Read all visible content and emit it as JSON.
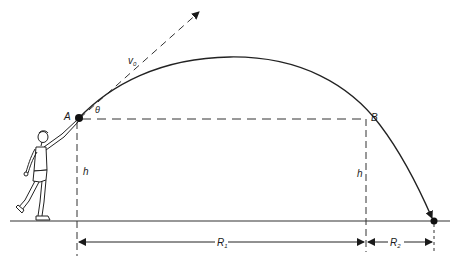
{
  "diagram": {
    "type": "projectile-motion",
    "colors": {
      "ink": "#1a1a1a",
      "dashed": "#333333",
      "background": "#ffffff"
    },
    "labels": {
      "point_a": "A",
      "point_b": "B",
      "velocity": "v",
      "velocity_sub": "0",
      "angle": "θ",
      "height_left": "h",
      "height_right": "h",
      "range_1": "R",
      "range_1_sub": "1",
      "range_2": "R",
      "range_2_sub": "2"
    },
    "elements": [
      "thrower-figure",
      "ground-line",
      "trajectory-curve",
      "initial-velocity-arrow",
      "launch-height-line",
      "range-dimension-arrows"
    ]
  }
}
